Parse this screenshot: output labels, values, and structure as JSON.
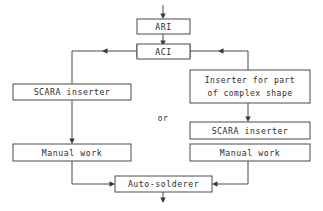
{
  "diagram": {
    "type": "flowchart",
    "stroke_color": "#4a4a4a",
    "text_color": "#2b2b2b",
    "background_color": "#ffffff",
    "nodes": [
      {
        "id": "ari",
        "label": "ARI"
      },
      {
        "id": "aci",
        "label": "ACI"
      },
      {
        "id": "scara_left",
        "label": "SCARA inserter"
      },
      {
        "id": "inserter_complex_line1",
        "label": "Inserter for part"
      },
      {
        "id": "inserter_complex_line2",
        "label": "of complex shape"
      },
      {
        "id": "scara_right",
        "label": "SCARA inserter"
      },
      {
        "id": "manual_left",
        "label": "Manual work"
      },
      {
        "id": "manual_right",
        "label": "Manual work"
      },
      {
        "id": "auto_solderer",
        "label": "Auto-solderer"
      }
    ],
    "annotations": [
      {
        "id": "or_label",
        "label": "or"
      }
    ]
  }
}
